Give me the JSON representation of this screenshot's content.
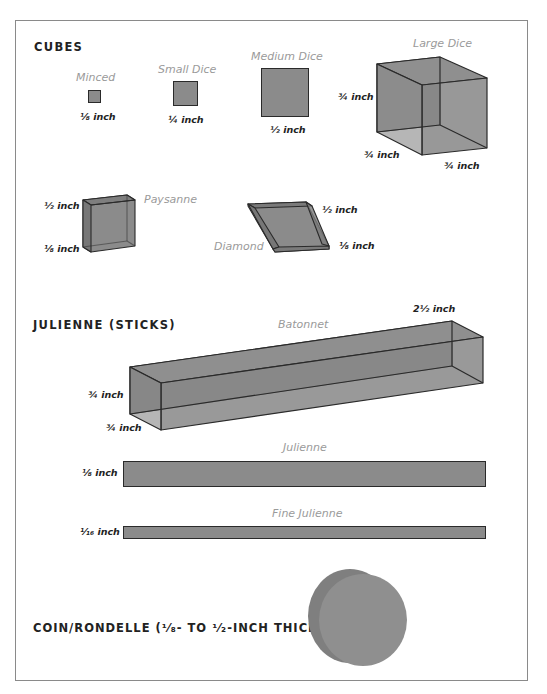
{
  "diagram": {
    "colors": {
      "fill": "#8b8b8b",
      "fill_dark": "#7a7a7a",
      "edge": "#2a2a2a",
      "frame": "#8a8a8a",
      "cut_name_text": "#9a9a9a",
      "label_text": "#222222"
    },
    "sections": {
      "cubes": {
        "title": "CUBES",
        "cuts": {
          "minced": {
            "name": "Minced",
            "dimension": "⅛ inch"
          },
          "small_dice": {
            "name": "Small Dice",
            "dimension": "¼ inch"
          },
          "medium_dice": {
            "name": "Medium Dice",
            "dimension": "½ inch"
          },
          "large_dice": {
            "name": "Large Dice",
            "dimensions": [
              "¾ inch",
              "¾ inch",
              "¾ inch"
            ]
          },
          "paysanne": {
            "name": "Paysanne",
            "dimensions": [
              "½ inch",
              "⅛ inch"
            ]
          },
          "diamond": {
            "name": "Diamond",
            "dimensions": [
              "½ inch",
              "⅛ inch"
            ]
          }
        }
      },
      "julienne": {
        "title": "JULIENNE (STICKS)",
        "cuts": {
          "batonnet": {
            "name": "Batonnet",
            "dimensions": [
              "2½ inch",
              "¾ inch",
              "¾ inch"
            ]
          },
          "julienne": {
            "name": "Julienne",
            "dimension": "⅛ inch"
          },
          "fine_julienne": {
            "name": "Fine Julienne",
            "dimension": "¹⁄₁₆ inch"
          }
        }
      },
      "coin": {
        "title": "COIN/RONDELLE (¹⁄₈- TO ¹⁄₂-INCH THICK)"
      }
    }
  }
}
